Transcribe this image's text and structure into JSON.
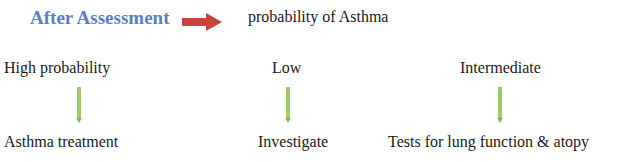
{
  "header": {
    "title": "After Assessment",
    "arrow_icon": "right-arrow-icon",
    "subtitle": "probability of Asthma"
  },
  "branches": [
    {
      "category": "High probability",
      "arrow_icon": "down-arrow-icon",
      "outcome": "Asthma treatment"
    },
    {
      "category": "Low",
      "arrow_icon": "down-arrow-icon",
      "outcome": "Investigate"
    },
    {
      "category": "Intermediate",
      "arrow_icon": "down-arrow-icon",
      "outcome": "Tests for lung function & atopy"
    }
  ],
  "colors": {
    "title": "#5b7fc4",
    "right_arrow": "#c9433a",
    "down_arrow": "#9ccc65"
  }
}
